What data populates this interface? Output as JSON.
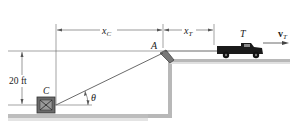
{
  "diagram": {
    "labels": {
      "xc": "x",
      "xc_sub": "C",
      "xt": "x",
      "xt_sub": "T",
      "point_a": "A",
      "truck": "T",
      "velocity": "v",
      "velocity_sub": "T",
      "height": "20 ft",
      "crate": "C",
      "angle": "θ"
    },
    "colors": {
      "line": "#555555",
      "ground": "#b0b0b0",
      "ground_shadow": "#d8d8d8",
      "truck": "#1a1a1a",
      "crate": "#6a6a6a"
    }
  }
}
